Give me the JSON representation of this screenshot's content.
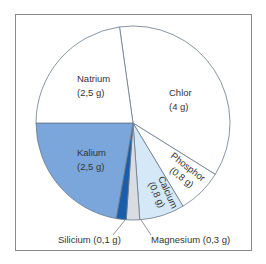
{
  "chart_data": {
    "type": "pie",
    "title": "",
    "unit": "g",
    "total": 11.0,
    "start_angle_deg": -8,
    "direction": "clockwise",
    "slices": [
      {
        "name": "Chlor",
        "value": 4.0,
        "label": "Chlor",
        "value_label": "(4 g)",
        "color": "#ffffff",
        "start": -8,
        "end": 122
      },
      {
        "name": "Phosphor",
        "value": 0.8,
        "label": "Phosphor",
        "value_label": "(0,8 g)",
        "color": "#ffffff",
        "start": 122,
        "end": 149
      },
      {
        "name": "Calcium",
        "value": 0.8,
        "label": "Calcium",
        "value_label": "(0,8 g)",
        "color": "#d4e8f8",
        "start": 149,
        "end": 176
      },
      {
        "name": "Magnesium",
        "value": 0.3,
        "label": "Magnesium (0,3 g)",
        "color": "#d9dde2",
        "start": 176,
        "end": 184
      },
      {
        "name": "Silicium",
        "value": 0.1,
        "label": "Silicium (0,1 g)",
        "color": "#1a5eab",
        "start": 184,
        "end": 190
      },
      {
        "name": "Kalium",
        "value": 2.5,
        "label": "Kalium",
        "value_label": "(2,5 g)",
        "color": "#7ba6db",
        "start": 190,
        "end": 270
      },
      {
        "name": "Natrium",
        "value": 2.5,
        "label": "Natrium",
        "value_label": "(2,5 g)",
        "color": "#ffffff",
        "start": 270,
        "end": 352
      }
    ],
    "legend": "none",
    "border_color": "#8a8a8a",
    "line_color": "#6a7a8a"
  }
}
